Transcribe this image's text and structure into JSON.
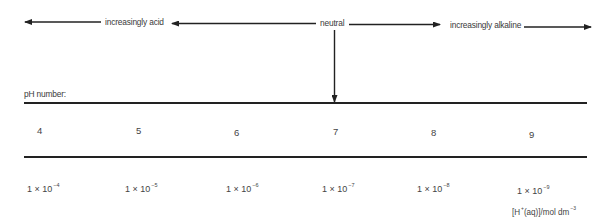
{
  "scale": {
    "acid_label": "increasingly acid",
    "neutral_label": "neutral",
    "alkaline_label": "increasingly alkaline"
  },
  "table": {
    "ph_heading": "pH number:",
    "ph_values": [
      "4",
      "5",
      "6",
      "7",
      "8",
      "9"
    ],
    "concentrations": [
      {
        "mantissa": "1 × 10",
        "exponent": "−4"
      },
      {
        "mantissa": "1 × 10",
        "exponent": "−5"
      },
      {
        "mantissa": "1 × 10",
        "exponent": "−6"
      },
      {
        "mantissa": "1 × 10",
        "exponent": "−7"
      },
      {
        "mantissa": "1 × 10",
        "exponent": "−8"
      },
      {
        "mantissa": "1 × 10",
        "exponent": "−9"
      }
    ],
    "unit": {
      "prefix": "[H",
      "charge": "+",
      "middle": "(aq)]/mol dm",
      "exponent": "−3"
    }
  },
  "colors": {
    "line": "#222222",
    "text": "#3a3a3a"
  }
}
